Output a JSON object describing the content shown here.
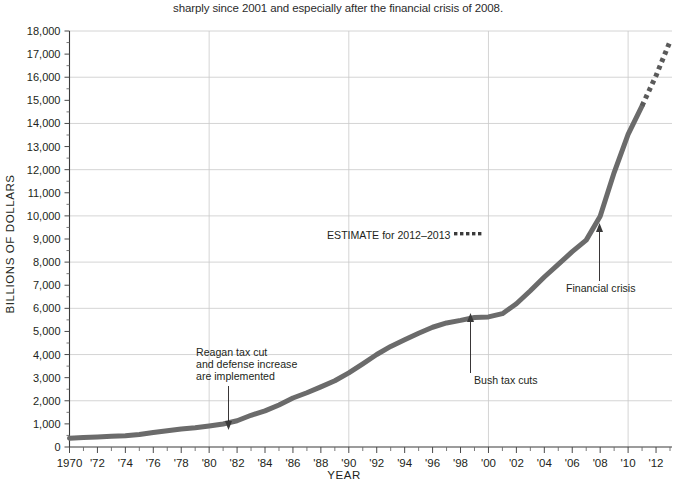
{
  "caption": "sharply since 2001 and especially after the financial crisis of 2008.",
  "axes": {
    "ylabel": "BILLIONS OF DOLLARS",
    "xlabel": "YEAR"
  },
  "annotations": {
    "reagan": {
      "line1": "Reagan tax cut",
      "line2": "and defense increase",
      "line3": "are implemented"
    },
    "bush": "Bush tax cuts",
    "crisis": "Financial crisis",
    "estimate": "ESTIMATE for 2012–2013"
  },
  "chart_data": {
    "type": "line",
    "title": "",
    "xlabel": "YEAR",
    "ylabel": "BILLIONS OF DOLLARS",
    "xlim": [
      1970,
      2013
    ],
    "ylim": [
      0,
      18000
    ],
    "grid": true,
    "legend_position": "none",
    "ytick_labels": [
      "0",
      "1,000",
      "2,000",
      "3,000",
      "4,000",
      "5,000",
      "6,000",
      "7,000",
      "8,000",
      "9,000",
      "10,000",
      "11,000",
      "12,000",
      "13,000",
      "14,000",
      "15,000",
      "16,000",
      "17,000",
      "18,000"
    ],
    "ytick_values": [
      0,
      1000,
      2000,
      3000,
      4000,
      5000,
      6000,
      7000,
      8000,
      9000,
      10000,
      11000,
      12000,
      13000,
      14000,
      15000,
      16000,
      17000,
      18000
    ],
    "xtick_labels": [
      "1970",
      "'72",
      "'74",
      "'76",
      "'78",
      "'80",
      "'82",
      "'84",
      "'86",
      "'88",
      "'90",
      "'92",
      "'94",
      "'96",
      "'98",
      "'00",
      "'02",
      "'04",
      "'06",
      "'08",
      "'10",
      "'12"
    ],
    "xtick_values": [
      1970,
      1972,
      1974,
      1976,
      1978,
      1980,
      1982,
      1984,
      1986,
      1988,
      1990,
      1992,
      1994,
      1996,
      1998,
      2000,
      2002,
      2004,
      2006,
      2008,
      2010,
      2012
    ],
    "gridline_y_values": [
      2000,
      4000,
      6000,
      8000,
      10000,
      12000,
      14000,
      16000,
      18000
    ],
    "gridline_x_values": [
      1980,
      1990,
      2000,
      2010
    ],
    "series": [
      {
        "name": "Gross federal debt",
        "style": "solid",
        "x": [
          1970,
          1971,
          1972,
          1973,
          1974,
          1975,
          1976,
          1977,
          1978,
          1979,
          1980,
          1981,
          1982,
          1983,
          1984,
          1985,
          1986,
          1987,
          1988,
          1989,
          1990,
          1991,
          1992,
          1993,
          1994,
          1995,
          1996,
          1997,
          1998,
          1999,
          2000,
          2001,
          2002,
          2003,
          2004,
          2005,
          2006,
          2007,
          2008,
          2009,
          2010,
          2011
        ],
        "values": [
          381,
          408,
          436,
          466,
          484,
          542,
          629,
          706,
          777,
          829,
          909,
          995,
          1137,
          1372,
          1565,
          1818,
          2120,
          2346,
          2601,
          2868,
          3206,
          3598,
          4002,
          4351,
          4643,
          4921,
          5181,
          5369,
          5478,
          5606,
          5628,
          5769,
          6198,
          6760,
          7355,
          7905,
          8451,
          8951,
          9986,
          11876,
          13529,
          14764
        ]
      },
      {
        "name": "Estimate 2012–2013",
        "style": "dotted",
        "x": [
          2011,
          2012,
          2013
        ],
        "values": [
          14764,
          16066,
          17547
        ]
      }
    ],
    "callouts": [
      {
        "label": "Reagan tax cut and defense increase are implemented",
        "x": 1982,
        "y": 1137
      },
      {
        "label": "Bush tax cuts",
        "x": 2001,
        "y": 5769
      },
      {
        "label": "Financial crisis",
        "x": 2008,
        "y": 9986
      }
    ]
  }
}
